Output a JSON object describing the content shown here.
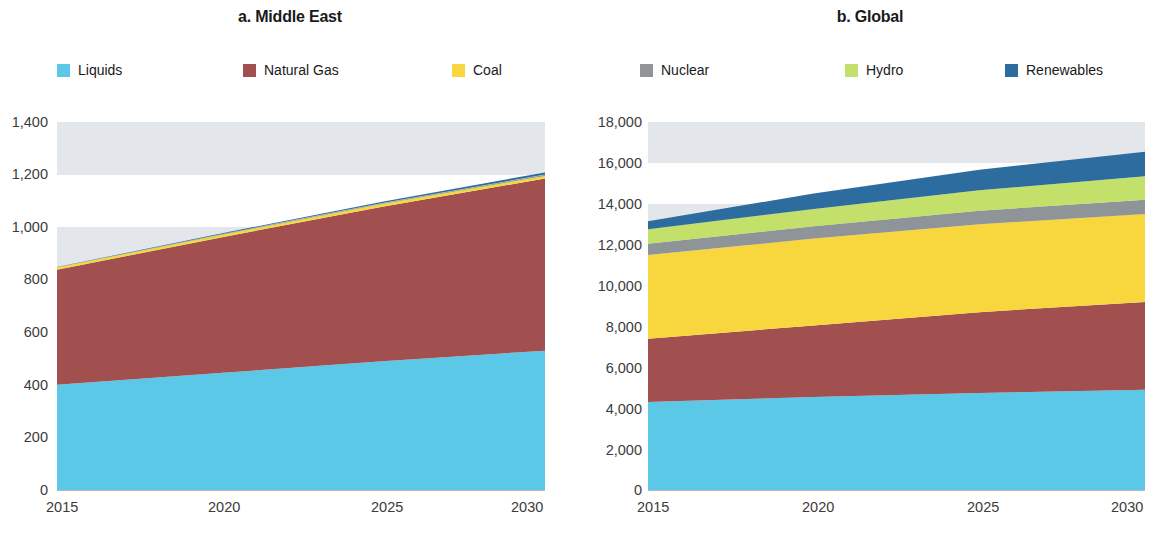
{
  "figure": {
    "panels": [
      {
        "id": "middle-east",
        "title": "a. Middle East",
        "legend": [
          {
            "label": "Liquids",
            "color": "#5BC8E8",
            "key": "liquids"
          },
          {
            "label": "Natural Gas",
            "color": "#A2504F",
            "key": "natural_gas"
          },
          {
            "label": "Coal",
            "color": "#F7D63E",
            "key": "coal"
          }
        ]
      },
      {
        "id": "global",
        "title": "b. Global",
        "legend": [
          {
            "label": "Nuclear",
            "color": "#8E9498",
            "key": "nuclear"
          },
          {
            "label": "Hydro",
            "color": "#C2E06A",
            "key": "hydro"
          },
          {
            "label": "Renewables",
            "color": "#2D6C9E",
            "key": "renewables"
          }
        ]
      }
    ]
  },
  "chart_data": [
    {
      "type": "area",
      "stacked": true,
      "title": "a. Middle East",
      "xlabel": "",
      "ylabel": "",
      "x": [
        2015,
        2020,
        2025,
        2030
      ],
      "xticks": [
        "2015",
        "2020",
        "2025",
        "2030"
      ],
      "xlim": [
        2015,
        2030
      ],
      "ylim": [
        0,
        1400
      ],
      "yticks": [
        "0",
        "200",
        "400",
        "600",
        "800",
        "1,000",
        "1,200",
        "1,400"
      ],
      "ytick_values": [
        0,
        200,
        400,
        600,
        800,
        1000,
        1200,
        1400
      ],
      "grid": false,
      "legend_position": "top",
      "series": [
        {
          "name": "Liquids",
          "color": "#5BC8E8",
          "values": [
            400,
            445,
            490,
            530
          ]
        },
        {
          "name": "Natural Gas",
          "color": "#A2504F",
          "values": [
            438,
            515,
            588,
            655
          ]
        },
        {
          "name": "Coal",
          "color": "#F7D63E",
          "values": [
            8,
            9,
            10,
            10
          ]
        },
        {
          "name": "Nuclear",
          "color": "#8E9498",
          "values": [
            0,
            2,
            3,
            4
          ]
        },
        {
          "name": "Hydro",
          "color": "#C2E06A",
          "values": [
            1,
            1,
            1,
            1
          ]
        },
        {
          "name": "Renewables",
          "color": "#2D6C9E",
          "values": [
            1,
            3,
            5,
            8
          ]
        }
      ],
      "cumulative_tops": {
        "liquids": [
          400,
          445,
          490,
          530
        ],
        "natural_gas": [
          838,
          960,
          1078,
          1185
        ],
        "coal": [
          846,
          969,
          1088,
          1195
        ],
        "nuclear": [
          846,
          971,
          1091,
          1199
        ],
        "hydro": [
          847,
          972,
          1092,
          1200
        ],
        "renewables": [
          848,
          975,
          1097,
          1208
        ]
      }
    },
    {
      "type": "area",
      "stacked": true,
      "title": "b. Global",
      "xlabel": "",
      "ylabel": "",
      "x": [
        2015,
        2020,
        2025,
        2030
      ],
      "xticks": [
        "2015",
        "2020",
        "2025",
        "2030"
      ],
      "xlim": [
        2015,
        2030
      ],
      "ylim": [
        0,
        18000
      ],
      "yticks": [
        "0",
        "2,000",
        "4,000",
        "6,000",
        "8,000",
        "10,000",
        "12,000",
        "14,000",
        "16,000",
        "18,000"
      ],
      "ytick_values": [
        0,
        2000,
        4000,
        6000,
        8000,
        10000,
        12000,
        14000,
        16000,
        18000
      ],
      "grid": false,
      "legend_position": "top",
      "series": [
        {
          "name": "Liquids",
          "color": "#5BC8E8",
          "values": [
            4300,
            4550,
            4750,
            4900
          ]
        },
        {
          "name": "Natural Gas",
          "color": "#A2504F",
          "values": [
            3100,
            3500,
            3950,
            4300
          ]
        },
        {
          "name": "Coal",
          "color": "#F7D63E",
          "values": [
            4100,
            4250,
            4300,
            4300
          ]
        },
        {
          "name": "Nuclear",
          "color": "#8E9498",
          "values": [
            550,
            600,
            660,
            700
          ]
        },
        {
          "name": "Hydro",
          "color": "#C2E06A",
          "values": [
            700,
            850,
            1000,
            1150
          ]
        },
        {
          "name": "Renewables",
          "color": "#2D6C9E",
          "values": [
            400,
            750,
            1000,
            1200
          ]
        }
      ],
      "cumulative_tops": {
        "liquids": [
          4300,
          4550,
          4750,
          4900
        ],
        "natural_gas": [
          7400,
          8050,
          8700,
          9200
        ],
        "coal": [
          11500,
          12300,
          13000,
          13500
        ],
        "nuclear": [
          12050,
          12900,
          13660,
          14200
        ],
        "hydro": [
          12750,
          13750,
          14660,
          15350
        ],
        "renewables": [
          13150,
          14500,
          15660,
          16550
        ]
      }
    }
  ]
}
